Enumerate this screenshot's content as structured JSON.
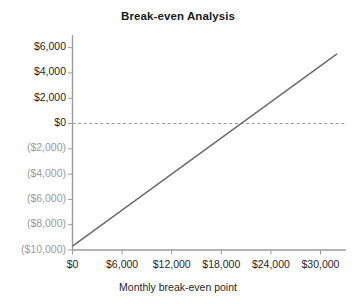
{
  "chart_data": {
    "type": "line",
    "title": "Break-even Analysis",
    "xlabel": "Monthly break-even point",
    "ylabel": "",
    "xlim": [
      0,
      32000
    ],
    "ylim": [
      -10000,
      7000
    ],
    "grid": false,
    "legend": null,
    "x_ticks": [
      0,
      6000,
      12000,
      18000,
      24000,
      30000
    ],
    "x_tick_labels": [
      "$0",
      "$6,000",
      "$12,000",
      "$18,000",
      "$24,000",
      "$30,000"
    ],
    "y_ticks": [
      6000,
      4000,
      2000,
      0,
      -2000,
      -4000,
      -6000,
      -8000,
      -10000
    ],
    "y_tick_labels": [
      "$6,000",
      "$4,000",
      "$2,000",
      "$0",
      "($2,000)",
      "($4,000)",
      "($6,000)",
      "($8,000)",
      "($10,000)"
    ],
    "series": [
      {
        "name": "Profit",
        "color": "#6b6b6b",
        "x": [
          0,
          32000
        ],
        "values": [
          -9700,
          5500
        ]
      }
    ],
    "annotations": [
      {
        "name": "zero-reference-line",
        "type": "hline",
        "y": 0,
        "style": "dashed",
        "color": "#9b9b9b"
      }
    ],
    "break_even_x": 20700,
    "axis_color": "#9b9b9b",
    "tick_color": "#9b9b9b",
    "negative_label_color": "#9a9a9a",
    "label_color": "#1f1f1f"
  }
}
